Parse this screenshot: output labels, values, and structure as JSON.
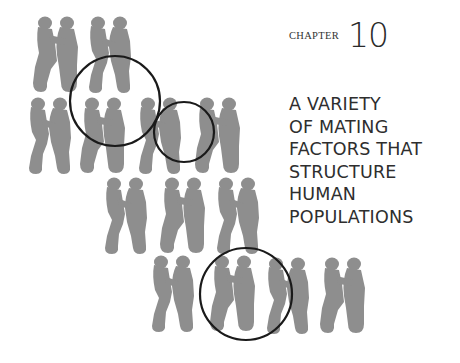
{
  "chapter": {
    "label": "CHAPTER",
    "number": "10"
  },
  "title": {
    "lines": [
      "A VARIETY",
      "OF MATING",
      "FACTORS THAT",
      "STRUCTURE",
      "HUMAN",
      "POPULATIONS"
    ]
  },
  "illustration": {
    "description": "rows of grey silhouetted embracing couples with three black circles highlighting pairs",
    "figure_color": "#8e8e8e",
    "circle_color": "#1a1a1a",
    "circles": [
      {
        "cx": 115,
        "cy": 101,
        "r": 45
      },
      {
        "cx": 184,
        "cy": 132,
        "r": 30
      },
      {
        "cx": 246,
        "cy": 294,
        "r": 46
      }
    ]
  }
}
